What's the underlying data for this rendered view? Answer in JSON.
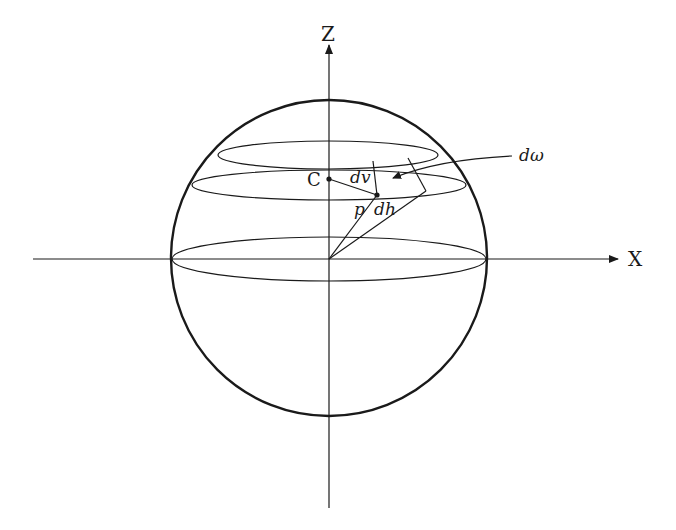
{
  "diagram": {
    "type": "sphere-solid-angle",
    "colors": {
      "stroke": "#1a1a1a",
      "background": "#ffffff"
    },
    "axes": {
      "z_label": "Z",
      "x_label": "X"
    },
    "labels": {
      "center_point": "C",
      "vertical_element": "dv",
      "horizontal_element": "dh",
      "radius_point": "p",
      "solid_angle": "dω"
    }
  }
}
